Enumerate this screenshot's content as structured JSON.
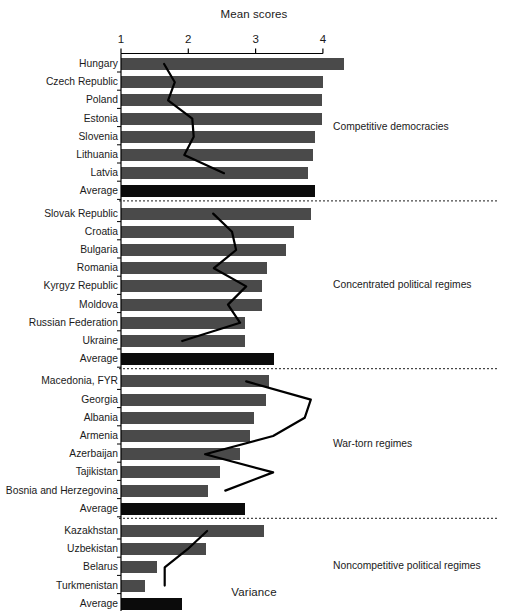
{
  "chart_titles": {
    "top_axis_title": "Mean scores",
    "bottom_axis_title": "Variance"
  },
  "chart_data": {
    "type": "bar",
    "title": "",
    "xlabel": "Variance",
    "ylabel": "",
    "top_axis": {
      "label": "Mean scores",
      "ticks": [
        1,
        2,
        3,
        4
      ],
      "range": [
        1,
        4
      ]
    },
    "bottom_axis": {
      "label": "Variance",
      "ticks": [
        0,
        0.4,
        0.8,
        1.2
      ],
      "range": [
        0,
        1.2
      ]
    },
    "grid": false,
    "legend": null,
    "orientation": "horizontal",
    "bar_color": "#4a4a4a",
    "average_bar_color": "#0b0b0b",
    "line_color": "#000000",
    "groups": [
      {
        "name": "Competitive democracies",
        "rows": [
          {
            "category": "Hungary",
            "variance": 1.31,
            "mean": 1.64,
            "is_average": false
          },
          {
            "category": "Czech Republic",
            "variance": 1.19,
            "mean": 1.8,
            "is_average": false
          },
          {
            "category": "Poland",
            "variance": 1.18,
            "mean": 1.7,
            "is_average": false
          },
          {
            "category": "Estonia",
            "variance": 1.18,
            "mean": 2.06,
            "is_average": false
          },
          {
            "category": "Slovenia",
            "variance": 1.14,
            "mean": 2.08,
            "is_average": false
          },
          {
            "category": "Lithuania",
            "variance": 1.13,
            "mean": 1.94,
            "is_average": false
          },
          {
            "category": "Latvia",
            "variance": 1.1,
            "mean": 2.53,
            "is_average": false
          },
          {
            "category": "Average",
            "variance": 1.14,
            "mean": null,
            "is_average": true
          }
        ]
      },
      {
        "name": "Concentrated political regimes",
        "rows": [
          {
            "category": "Slovak Republic",
            "variance": 1.12,
            "mean": 2.37,
            "is_average": false
          },
          {
            "category": "Croatia",
            "variance": 1.02,
            "mean": 2.65,
            "is_average": false
          },
          {
            "category": "Bulgaria",
            "variance": 0.97,
            "mean": 2.71,
            "is_average": false
          },
          {
            "category": "Romania",
            "variance": 0.86,
            "mean": 2.38,
            "is_average": false
          },
          {
            "category": "Kyrgyz Republic",
            "variance": 0.83,
            "mean": 2.86,
            "is_average": false
          },
          {
            "category": "Moldova",
            "variance": 0.83,
            "mean": 2.59,
            "is_average": false
          },
          {
            "category": "Russian Federation",
            "variance": 0.73,
            "mean": 2.77,
            "is_average": false
          },
          {
            "category": "Ukraine",
            "variance": 0.73,
            "mean": 1.91,
            "is_average": false
          },
          {
            "category": "Average",
            "variance": 0.9,
            "mean": null,
            "is_average": true
          }
        ]
      },
      {
        "name": "War-torn regimes",
        "rows": [
          {
            "category": "Macedonia, FYR",
            "variance": 0.87,
            "mean": 2.86,
            "is_average": false
          },
          {
            "category": "Georgia",
            "variance": 0.85,
            "mean": 3.82,
            "is_average": false
          },
          {
            "category": "Albania",
            "variance": 0.78,
            "mean": 3.73,
            "is_average": false
          },
          {
            "category": "Armenia",
            "variance": 0.76,
            "mean": 3.26,
            "is_average": false
          },
          {
            "category": "Azerbaijan",
            "variance": 0.7,
            "mean": 2.25,
            "is_average": false
          },
          {
            "category": "Tajikistan",
            "variance": 0.58,
            "mean": 3.26,
            "is_average": false
          },
          {
            "category": "Bosnia and Herzegovina",
            "variance": 0.51,
            "mean": 2.55,
            "is_average": false
          },
          {
            "category": "Average",
            "variance": 0.73,
            "mean": null,
            "is_average": true
          }
        ]
      },
      {
        "name": "Noncompetitive political regimes",
        "rows": [
          {
            "category": "Kazakhstan",
            "variance": 0.84,
            "mean": 2.28,
            "is_average": false
          },
          {
            "category": "Uzbekistan",
            "variance": 0.5,
            "mean": 1.99,
            "is_average": false
          },
          {
            "category": "Belarus",
            "variance": 0.21,
            "mean": 1.65,
            "is_average": false
          },
          {
            "category": "Turkmenistan",
            "variance": 0.14,
            "mean": 1.65,
            "is_average": false
          },
          {
            "category": "Average",
            "variance": 0.36,
            "mean": null,
            "is_average": true
          }
        ]
      }
    ]
  }
}
